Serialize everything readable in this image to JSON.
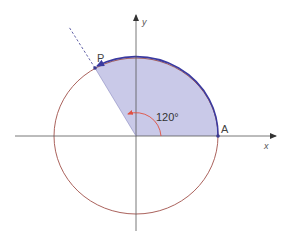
{
  "figure": {
    "type": "unit-circle-angle-diagram",
    "labels": {
      "x_axis": "x",
      "y_axis": "y",
      "point_A": "A",
      "point_P": "P",
      "angle": "120°"
    },
    "angle_degrees": 120,
    "colors": {
      "sector_fill": "#c9c9e8",
      "arc_stroke": "#3a3aa0",
      "circle_stroke": "#a0504a",
      "angle_marker": "#e05040",
      "axis_stroke": "#555555",
      "dashed_ray": "#3a3a90",
      "point_fill": "#3a3a90"
    }
  }
}
